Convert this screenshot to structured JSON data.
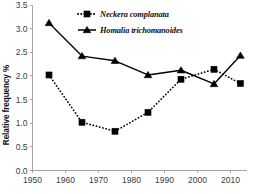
{
  "chart_data": {
    "type": "line",
    "title": "",
    "subtitle": "",
    "xlabel": "",
    "ylabel": "Relative frequency %",
    "x": [
      1955,
      1965,
      1975,
      1985,
      1995,
      2005,
      2013
    ],
    "xlim": [
      1950,
      2015
    ],
    "ylim": [
      0.0,
      3.5
    ],
    "xticks": [
      1950,
      1960,
      1970,
      1980,
      1990,
      2000,
      2010
    ],
    "xtick_labels": [
      "1950",
      "1960",
      "1970",
      "1980",
      "1990",
      "2000",
      "2010"
    ],
    "yticks": [
      0.0,
      0.5,
      1.0,
      1.5,
      2.0,
      2.5,
      3.0,
      3.5
    ],
    "ytick_labels": [
      "0.0",
      "0.5",
      "1.0",
      "1.5",
      "2.0",
      "2.5",
      "3.0",
      "3.5"
    ],
    "grid": false,
    "legend_position": "top-center",
    "series": [
      {
        "name": "Neckera complanata",
        "values": [
          2.02,
          1.02,
          0.83,
          1.23,
          1.93,
          2.14,
          1.84
        ],
        "linestyle": "dotted",
        "marker": "square",
        "color": "#000000"
      },
      {
        "name": "Homalia trichomanoides",
        "values": [
          3.12,
          2.42,
          2.32,
          2.02,
          2.12,
          1.83,
          2.43
        ],
        "linestyle": "solid",
        "marker": "triangle",
        "color": "#000000"
      }
    ]
  },
  "legend": {
    "items": [
      {
        "label": "Neckera complanata",
        "marker": "square-marker-icon",
        "linestyle": "dotted"
      },
      {
        "label": "Homalia trichomanoides",
        "marker": "triangle-marker-icon",
        "linestyle": "solid"
      }
    ]
  },
  "colors": {
    "series": "#000000",
    "axis": "#a6a6a6",
    "tick_text": "#3b3b3b",
    "background": "#ffffff"
  }
}
